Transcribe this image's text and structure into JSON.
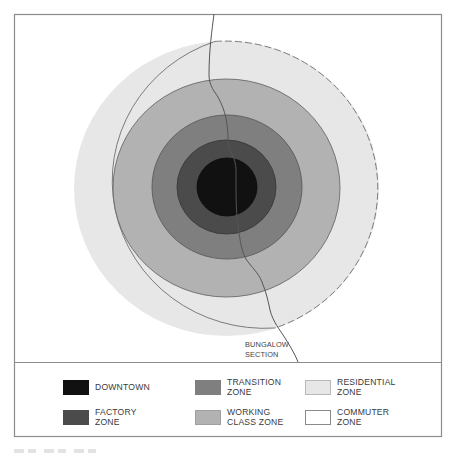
{
  "diagram": {
    "frame": {
      "x": 14,
      "y": 14,
      "width": 428,
      "height": 423,
      "divider_y": 362,
      "stroke": "#8c8c8c"
    },
    "zones": [
      {
        "id": "commuter",
        "label": "COMMUTER\nZONE",
        "fill": "#ffffff"
      },
      {
        "id": "residential",
        "label": "RESIDENTIAL\nZONE",
        "fill": "#e7e7e7",
        "cx": 226.5,
        "cy": 188.5,
        "rx": 152.5,
        "ry": 147.5
      },
      {
        "id": "working_class",
        "label": "WORKING\nCLASS ZONE",
        "fill": "#b2b2b2",
        "cx": 226.5,
        "cy": 188,
        "rx": 113.5,
        "ry": 109
      },
      {
        "id": "transition",
        "label": "TRANSITION\nZONE",
        "fill": "#7f7f7f",
        "cx": 227,
        "cy": 187,
        "rx": 75,
        "ry": 72
      },
      {
        "id": "factory",
        "label": "FACTORY\nZONE",
        "fill": "#4b4b4b",
        "cx": 226.5,
        "cy": 187,
        "rx": 49.5,
        "ry": 47
      },
      {
        "id": "downtown",
        "label": "DOWNTOWN",
        "fill": "#111111",
        "cx": 227,
        "cy": 187,
        "rx": 30,
        "ry": 29
      }
    ],
    "bungalow_line": {
      "path": "M214,14 C212,30 209,50 209,75 C209,86 215,92 218,97 C222,105 228,116 228,140 C228,150 236,157 236,170 C236,200 236,212 238,225 C240,242 242,252 246,259 C252,268 258,272 262,282 C266,292 268,300 270,310 C273,322 280,330 285,338 C290,346 295,354 298,362",
      "stroke": "#555555"
    },
    "annotation": {
      "label": "BUNGALOW\nSECTION",
      "x": 245,
      "y": 340
    }
  },
  "legend": {
    "items": [
      {
        "label": "DOWNTOWN",
        "color": "#111111"
      },
      {
        "label": "FACTORY\nZONE",
        "color": "#4b4b4b"
      },
      {
        "label": "TRANSITION\nZONE",
        "color": "#7f7f7f"
      },
      {
        "label": "WORKING\nCLASS ZONE",
        "color": "#b2b2b2"
      },
      {
        "label": "RESIDENTIAL\nZONE",
        "color": "#e7e7e7"
      },
      {
        "label": "COMMUTER\nZONE",
        "color": "#ffffff"
      }
    ]
  }
}
